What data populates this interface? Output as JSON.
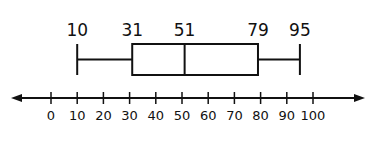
{
  "chart_data": {
    "type": "boxplot",
    "title": "",
    "xlabel": "",
    "ylabel": "",
    "five_number_summary": {
      "min": 10,
      "q1": 31,
      "median": 51,
      "q3": 79,
      "max": 95
    },
    "value_labels": [
      "10",
      "31",
      "51",
      "79",
      "95"
    ],
    "number_line": {
      "ticks": [
        0,
        10,
        20,
        30,
        40,
        50,
        60,
        70,
        80,
        90,
        100
      ],
      "tick_labels": [
        "0",
        "10",
        "20",
        "30",
        "40",
        "50",
        "60",
        "70",
        "80",
        "90",
        "100"
      ],
      "arrows_both_ends": true,
      "xlim": [
        -15,
        110
      ]
    },
    "grid": false,
    "legend": null
  },
  "colors": {
    "stroke": "#111111",
    "background": "#ffffff"
  }
}
